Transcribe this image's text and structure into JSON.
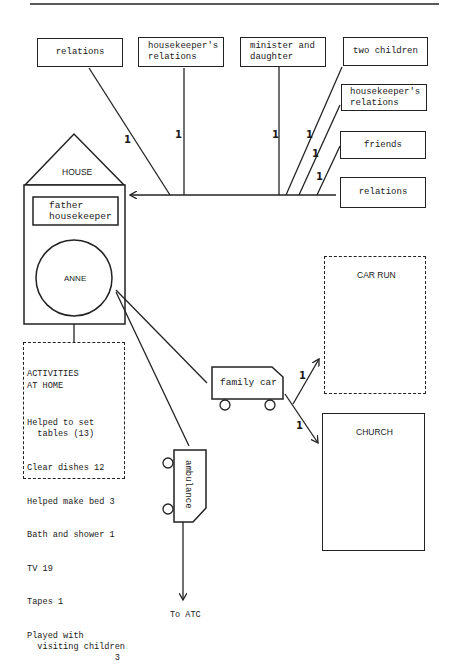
{
  "diagram": {
    "top_rule": true,
    "source_boxes": [
      {
        "id": "relations-1",
        "label": "relations"
      },
      {
        "id": "housekeepers-relations-1",
        "label": "housekeeper's\nrelations"
      },
      {
        "id": "minister-and-daughter",
        "label": "minister and\ndaughter"
      },
      {
        "id": "two-children",
        "label": "two children"
      },
      {
        "id": "housekeepers-relations-2",
        "label": "housekeeper's\nrelations"
      },
      {
        "id": "friends",
        "label": "friends"
      },
      {
        "id": "relations-2",
        "label": "relations"
      }
    ],
    "edge_counts": {
      "relations_1": "1",
      "housekeepers_relations_1": "1",
      "minister_and_daughter": "1",
      "two_children": "1",
      "housekeepers_relations_2": "1",
      "friends": "1",
      "car_to_car_run": "1",
      "car_to_church": "1"
    },
    "house": {
      "roof_label": "HOUSE",
      "residents": "father\nhousekeeper",
      "center_person": "ANNE"
    },
    "activities": {
      "title": "ACTIVITIES\nAT HOME",
      "items": [
        "Helped to set\n  tables (13)",
        "Clear dishes 12",
        "Helped make bed 3",
        "Bath and shower 1",
        "TV 19",
        "Tapes 1",
        "Played with\n  visiting children\n                 3"
      ]
    },
    "family_car": {
      "label": "family car"
    },
    "ambulance": {
      "label": "ambulance",
      "destination": "To ATC"
    },
    "destinations": {
      "car_run": "CAR RUN",
      "church": "CHURCH"
    }
  }
}
